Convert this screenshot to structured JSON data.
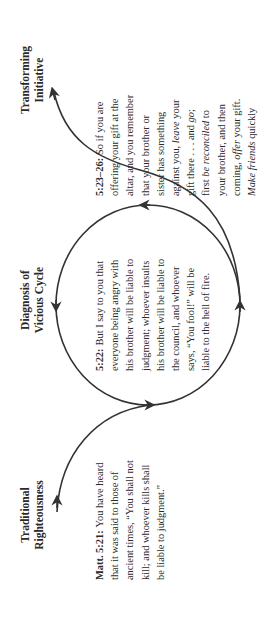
{
  "diagram": {
    "orientation": "rotated -90deg (text reads bottom-to-top)",
    "stroke_color": "#333333",
    "text_color": "#2a2a2a",
    "background": "#ffffff",
    "sections": [
      {
        "id": "traditional",
        "heading_lines": [
          "Traditional",
          "Righteousness"
        ],
        "reference": "Matt. 5:21:",
        "lines": [
          [
            {
              "t": "You have heard"
            }
          ],
          [
            {
              "t": "that it was said to those of"
            }
          ],
          [
            {
              "t": "ancient times, “You shall not"
            }
          ],
          [
            {
              "t": "kill; and whoever kills shall"
            }
          ],
          [
            {
              "t": "be liable to judgment.”"
            }
          ]
        ]
      },
      {
        "id": "diagnosis",
        "heading_lines": [
          "Diagnosis of",
          "Vicious Cycle"
        ],
        "reference": "5:22:",
        "lines": [
          [
            {
              "t": "But I say to you that"
            }
          ],
          [
            {
              "t": "everyone being angry with"
            }
          ],
          [
            {
              "t": "his brother will be liable to"
            }
          ],
          [
            {
              "t": "judgment; whoever insults"
            }
          ],
          [
            {
              "t": "his brother will be liable to"
            }
          ],
          [
            {
              "t": "the council, and whoever"
            }
          ],
          [
            {
              "t": "says, “You fool!” will be"
            }
          ],
          [
            {
              "t": "liable to the hell of fire."
            }
          ]
        ]
      },
      {
        "id": "transforming",
        "heading_lines": [
          "Transforming",
          "Initiative"
        ],
        "reference": "5:23–26:",
        "lines": [
          [
            {
              "t": "So if you are"
            }
          ],
          [
            {
              "t": "offering your gift at the"
            }
          ],
          [
            {
              "t": "altar, and you remember"
            }
          ],
          [
            {
              "t": "that your brother or"
            }
          ],
          [
            {
              "t": "sister has something"
            }
          ],
          [
            {
              "t": "against you, "
            },
            {
              "t": "leave",
              "i": true
            },
            {
              "t": " your"
            }
          ],
          [
            {
              "t": "gift there . . . and "
            },
            {
              "t": "go",
              "i": true
            },
            {
              "t": ";"
            }
          ],
          [
            {
              "t": "first "
            },
            {
              "t": "be reconciled",
              "i": true
            },
            {
              "t": " to"
            }
          ],
          [
            {
              "t": "your brother, and then"
            }
          ],
          [
            {
              "t": "coming, "
            },
            {
              "t": "offer",
              "i": true
            },
            {
              "t": " your gift."
            }
          ],
          [
            {
              "t": "Make friends",
              "i": true
            },
            {
              "t": " quickly"
            }
          ],
          [
            {
              "t": "with your accuser . . ."
            }
          ]
        ]
      }
    ],
    "connectors": [
      {
        "name": "traditional-to-cycle-curve",
        "arrow": "at start near Traditional Righteousness, pointing along curve"
      },
      {
        "name": "vicious-cycle-circle",
        "arrows": 4,
        "direction": "counter-clockwise as rendered"
      },
      {
        "name": "cycle-to-transforming-curve",
        "arrow": "at end near Transforming Initiative"
      }
    ]
  }
}
